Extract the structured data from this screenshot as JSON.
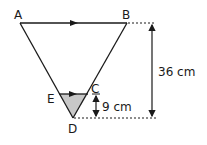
{
  "diagram": {
    "title": "",
    "colors": {
      "stroke": "#1a1a1a",
      "shade": "#c8c8c8",
      "background": "#ffffff"
    },
    "points": {
      "A": {
        "label": "A",
        "x": 20,
        "y": 23
      },
      "B": {
        "label": "B",
        "x": 127,
        "y": 23
      },
      "C": {
        "label": "C",
        "x": 88,
        "y": 94
      },
      "D": {
        "label": "D",
        "x": 73,
        "y": 118
      },
      "E": {
        "label": "E",
        "x": 59,
        "y": 94
      }
    },
    "parallel_marks": [
      "AB",
      "EC"
    ],
    "shaded_region": "triangle ECD",
    "dimensions": {
      "total_height": {
        "label": "36 cm",
        "from": "AB",
        "to": "D"
      },
      "small_height": {
        "label": "9 cm",
        "from": "EC",
        "to": "D"
      }
    }
  }
}
